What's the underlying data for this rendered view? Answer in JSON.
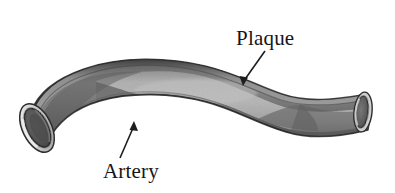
{
  "figure": {
    "background_color": "#ffffff",
    "type": "grayscale-anatomical-illustration",
    "width": 395,
    "height": 193
  },
  "labels": {
    "plaque": {
      "text": "Plaque",
      "font_color": "#161616",
      "position": "upper-right"
    },
    "artery": {
      "text": "Artery",
      "font_color": "#161616",
      "position": "lower-left"
    }
  },
  "annotations": [
    {
      "name": "plaque-leader-arrow",
      "points_to": "plaque-deposit",
      "direction": "down-left"
    },
    {
      "name": "artery-leader-arrow",
      "points_to": "artery-wall",
      "direction": "up-right"
    }
  ],
  "illustration": {
    "vessel_color_dark": "#6d6d6d",
    "vessel_color_mid": "#8a8a8a",
    "vessel_color_light": "#b9b9b9",
    "plaque_color": "#a8a8a8",
    "outline_color": "#2a2a2a",
    "rim_color": "#d8d8d8",
    "lumen_color": "#5a5a5a",
    "parts": [
      "artery-wall",
      "plaque-deposit",
      "left-lumen-opening",
      "right-lumen-opening"
    ]
  }
}
